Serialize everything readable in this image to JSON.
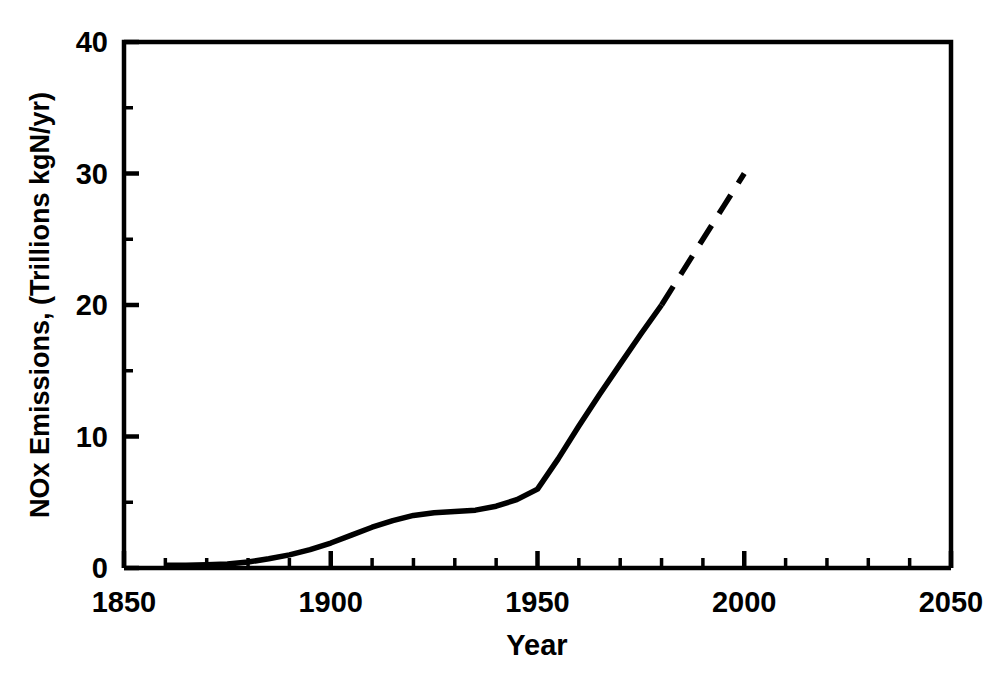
{
  "chart_data": {
    "type": "line",
    "title": "",
    "xlabel": "Year",
    "ylabel": "NOx Emissions, (Trillions kgN/yr)",
    "xlim": [
      1850,
      2050
    ],
    "ylim": [
      0,
      40
    ],
    "grid": false,
    "legend": null,
    "x_major_ticks": [
      1850,
      1900,
      1950,
      2000,
      2050
    ],
    "x_major_tick_labels": [
      "1850",
      "1900",
      "1950",
      "2000",
      "2050"
    ],
    "x_minor_tick_interval": 10,
    "y_major_ticks": [
      0,
      10,
      20,
      30,
      40
    ],
    "y_major_tick_labels": [
      "0",
      "10",
      "20",
      "30",
      "40"
    ],
    "y_minor_tick_interval": 5,
    "series": [
      {
        "name": "NOx emissions (historical)",
        "style": "solid",
        "color": "#000000",
        "x": [
          1860,
          1865,
          1870,
          1875,
          1880,
          1885,
          1890,
          1895,
          1900,
          1905,
          1910,
          1915,
          1920,
          1925,
          1930,
          1935,
          1940,
          1945,
          1950,
          1955,
          1960,
          1965,
          1970,
          1975,
          1980
        ],
        "y": [
          0.2,
          0.2,
          0.25,
          0.3,
          0.45,
          0.7,
          1.0,
          1.4,
          1.9,
          2.5,
          3.1,
          3.6,
          4.0,
          4.2,
          4.3,
          4.4,
          4.7,
          5.2,
          6.0,
          8.3,
          10.8,
          13.2,
          15.5,
          17.8,
          20.0
        ]
      },
      {
        "name": "NOx emissions (projected)",
        "style": "dashed",
        "color": "#000000",
        "x": [
          1980,
          1985,
          1990,
          1995,
          2000
        ],
        "y": [
          20.0,
          22.5,
          25.0,
          27.5,
          30.0
        ]
      }
    ]
  },
  "axis": {
    "x_title": "Year",
    "y_title": "NOx Emissions, (Trillions kgN/yr)",
    "x_labels": [
      "1850",
      "1900",
      "1950",
      "2000",
      "2050"
    ],
    "y_labels": [
      "0",
      "10",
      "20",
      "30",
      "40"
    ]
  }
}
